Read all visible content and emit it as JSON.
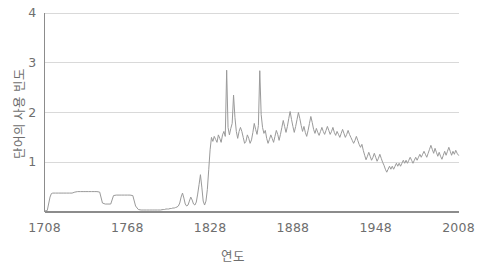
{
  "chart_data": {
    "type": "line",
    "title": "",
    "xlabel": "연도",
    "ylabel": "단어의 사용 빈도",
    "xlim": [
      1708,
      2008
    ],
    "ylim": [
      0,
      4
    ],
    "grid": true,
    "legend": false,
    "line_color": "#9a9a9a",
    "axis_color": "#8c8c8c",
    "grid_color": "#d9d9d9",
    "tick_color": "#6e6e6e",
    "xticks": [
      1708,
      1768,
      1828,
      1888,
      1948,
      2008
    ],
    "xtick_labels": [
      "1708",
      "1768",
      "1828",
      "1888",
      "1948",
      "2008"
    ],
    "yticks": [
      1,
      2,
      3,
      4
    ],
    "ytick_labels": [
      "1",
      "2",
      "3",
      "4"
    ],
    "series": [
      {
        "name": "단어의 사용 빈도",
        "x": [
          1708,
          1710,
          1712,
          1713,
          1714,
          1716,
          1718,
          1720,
          1722,
          1724,
          1726,
          1728,
          1730,
          1732,
          1734,
          1736,
          1738,
          1740,
          1742,
          1744,
          1746,
          1748,
          1750,
          1752,
          1754,
          1756,
          1758,
          1760,
          1762,
          1764,
          1766,
          1768,
          1770,
          1772,
          1774,
          1776,
          1778,
          1780,
          1782,
          1784,
          1786,
          1788,
          1790,
          1792,
          1794,
          1795,
          1796,
          1797,
          1798,
          1799,
          1800,
          1801,
          1802,
          1803,
          1804,
          1805,
          1806,
          1807,
          1808,
          1809,
          1810,
          1811,
          1812,
          1813,
          1814,
          1815,
          1816,
          1817,
          1818,
          1819,
          1820,
          1821,
          1822,
          1823,
          1824,
          1825,
          1826,
          1827,
          1828,
          1829,
          1830,
          1831,
          1832,
          1833,
          1834,
          1835,
          1836,
          1837,
          1838,
          1839,
          1840,
          1841,
          1842,
          1843,
          1844,
          1845,
          1846,
          1847,
          1848,
          1849,
          1850,
          1851,
          1852,
          1853,
          1854,
          1855,
          1856,
          1857,
          1858,
          1859,
          1860,
          1861,
          1862,
          1863,
          1864,
          1865,
          1866,
          1867,
          1868,
          1869,
          1870,
          1871,
          1872,
          1873,
          1874,
          1875,
          1876,
          1877,
          1878,
          1879,
          1880,
          1881,
          1882,
          1883,
          1884,
          1885,
          1886,
          1887,
          1888,
          1889,
          1890,
          1891,
          1892,
          1893,
          1894,
          1895,
          1896,
          1897,
          1898,
          1899,
          1900,
          1901,
          1902,
          1903,
          1904,
          1905,
          1906,
          1907,
          1908,
          1909,
          1910,
          1911,
          1912,
          1913,
          1914,
          1915,
          1916,
          1917,
          1918,
          1919,
          1920,
          1921,
          1922,
          1923,
          1924,
          1925,
          1926,
          1927,
          1928,
          1929,
          1930,
          1931,
          1932,
          1933,
          1934,
          1935,
          1936,
          1937,
          1938,
          1939,
          1940,
          1941,
          1942,
          1943,
          1944,
          1945,
          1946,
          1947,
          1948,
          1949,
          1950,
          1951,
          1952,
          1953,
          1954,
          1955,
          1956,
          1957,
          1958,
          1959,
          1960,
          1961,
          1962,
          1963,
          1964,
          1965,
          1966,
          1967,
          1968,
          1969,
          1970,
          1971,
          1972,
          1973,
          1974,
          1975,
          1976,
          1977,
          1978,
          1979,
          1980,
          1981,
          1982,
          1983,
          1984,
          1985,
          1986,
          1987,
          1988,
          1989,
          1990,
          1991,
          1992,
          1993,
          1994,
          1995,
          1996,
          1997,
          1998,
          1999,
          2000,
          2001,
          2002,
          2003,
          2004,
          2005,
          2006,
          2007,
          2008
        ],
        "y": [
          0.02,
          0.03,
          0.3,
          0.37,
          0.38,
          0.38,
          0.38,
          0.38,
          0.38,
          0.38,
          0.38,
          0.38,
          0.4,
          0.41,
          0.41,
          0.41,
          0.41,
          0.41,
          0.41,
          0.41,
          0.41,
          0.4,
          0.18,
          0.16,
          0.16,
          0.16,
          0.33,
          0.34,
          0.34,
          0.34,
          0.34,
          0.34,
          0.34,
          0.33,
          0.12,
          0.05,
          0.04,
          0.04,
          0.04,
          0.04,
          0.04,
          0.04,
          0.04,
          0.04,
          0.05,
          0.05,
          0.06,
          0.06,
          0.06,
          0.07,
          0.07,
          0.08,
          0.08,
          0.09,
          0.1,
          0.12,
          0.18,
          0.3,
          0.38,
          0.28,
          0.16,
          0.12,
          0.14,
          0.22,
          0.3,
          0.24,
          0.16,
          0.14,
          0.2,
          0.36,
          0.55,
          0.75,
          0.5,
          0.22,
          0.14,
          0.22,
          0.45,
          0.85,
          1.25,
          1.5,
          1.42,
          1.52,
          1.46,
          1.4,
          1.55,
          1.48,
          1.4,
          1.55,
          1.62,
          1.52,
          2.85,
          1.7,
          1.55,
          1.68,
          1.78,
          2.35,
          1.9,
          1.62,
          1.48,
          1.62,
          1.7,
          1.62,
          1.5,
          1.38,
          1.42,
          1.55,
          1.48,
          1.38,
          1.45,
          1.6,
          1.78,
          1.66,
          1.56,
          1.74,
          2.84,
          1.96,
          1.7,
          1.58,
          1.64,
          1.48,
          1.38,
          1.46,
          1.55,
          1.48,
          1.4,
          1.52,
          1.64,
          1.56,
          1.44,
          1.56,
          1.7,
          1.84,
          1.72,
          1.6,
          1.72,
          1.88,
          2.02,
          1.86,
          1.72,
          1.6,
          1.72,
          1.86,
          2.0,
          1.88,
          1.74,
          1.62,
          1.72,
          1.6,
          1.52,
          1.64,
          1.78,
          1.92,
          1.8,
          1.66,
          1.58,
          1.68,
          1.6,
          1.54,
          1.62,
          1.7,
          1.62,
          1.56,
          1.64,
          1.72,
          1.64,
          1.56,
          1.62,
          1.7,
          1.6,
          1.54,
          1.62,
          1.56,
          1.5,
          1.58,
          1.66,
          1.58,
          1.5,
          1.56,
          1.64,
          1.56,
          1.5,
          1.44,
          1.38,
          1.44,
          1.52,
          1.44,
          1.36,
          1.3,
          1.36,
          1.24,
          1.14,
          1.05,
          1.12,
          1.2,
          1.12,
          1.04,
          1.1,
          1.18,
          1.1,
          1.02,
          1.08,
          1.16,
          1.08,
          1.0,
          0.94,
          0.86,
          0.8,
          0.86,
          0.92,
          0.86,
          0.92,
          0.86,
          0.92,
          0.98,
          0.92,
          0.98,
          0.92,
          0.98,
          1.04,
          0.98,
          1.04,
          0.98,
          1.04,
          1.1,
          1.04,
          0.98,
          1.04,
          1.1,
          1.04,
          1.1,
          1.16,
          1.1,
          1.16,
          1.22,
          1.16,
          1.1,
          1.18,
          1.26,
          1.34,
          1.26,
          1.18,
          1.28,
          1.2,
          1.12,
          1.2,
          1.12,
          1.06,
          1.14,
          1.22,
          1.14,
          1.22,
          1.3,
          1.22,
          1.14,
          1.22,
          1.16,
          1.24,
          1.18,
          1.14
        ]
      }
    ]
  }
}
